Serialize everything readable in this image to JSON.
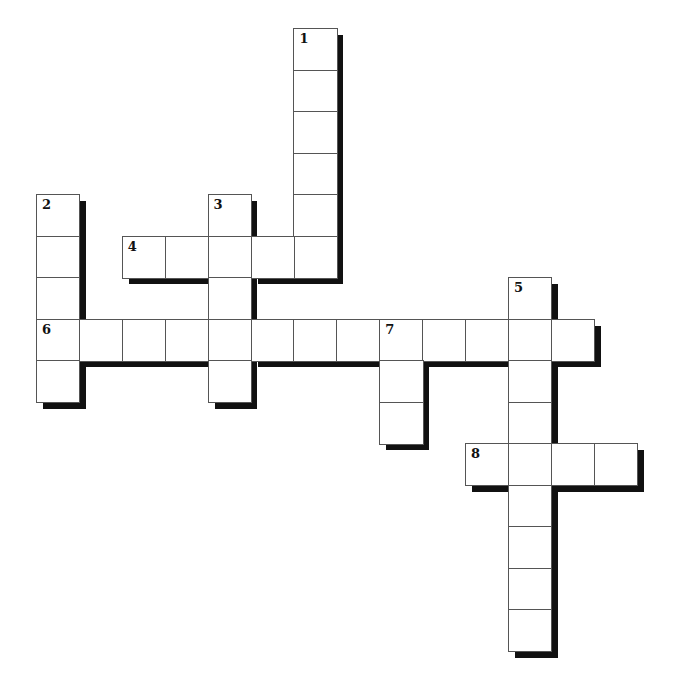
{
  "puzzle": {
    "type": "crossword",
    "grid": {
      "origin_x": 36,
      "origin_y": 28,
      "cell_w": 42.9,
      "cell_h": 41.5,
      "shadow_color": "#111111",
      "border_color": "#555555"
    },
    "entries": [
      {
        "number": "1",
        "direction": "down",
        "row": 0,
        "col": 6,
        "length": 6
      },
      {
        "number": "2",
        "direction": "down",
        "row": 4,
        "col": 0,
        "length": 5
      },
      {
        "number": "3",
        "direction": "down",
        "row": 4,
        "col": 4,
        "length": 5
      },
      {
        "number": "4",
        "direction": "across",
        "row": 5,
        "col": 2,
        "length": 5
      },
      {
        "number": "5",
        "direction": "down",
        "row": 6,
        "col": 11,
        "length": 9
      },
      {
        "number": "6",
        "direction": "across",
        "row": 7,
        "col": 0,
        "length": 13
      },
      {
        "number": "7",
        "direction": "down",
        "row": 7,
        "col": 8,
        "length": 3
      },
      {
        "number": "8",
        "direction": "across",
        "row": 10,
        "col": 10,
        "length": 4
      }
    ]
  }
}
